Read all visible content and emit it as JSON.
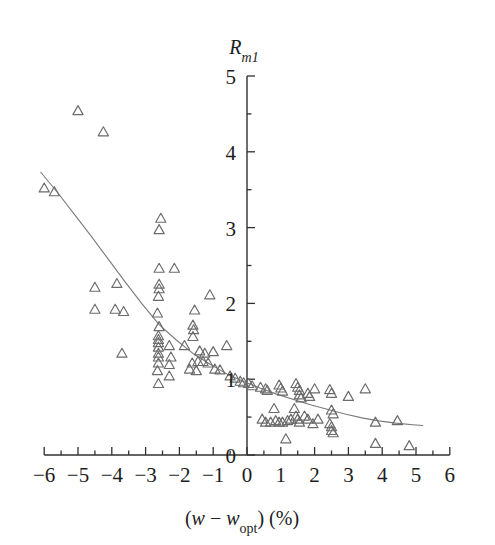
{
  "figure": {
    "background_color": "#ffffff",
    "marker_color": "#6b6b6b",
    "curve_color": "#7a7a7a",
    "axis_color": "#303030"
  },
  "axes": {
    "x": {
      "label_prefix": "(",
      "label_var1": "w",
      "label_minus": " − ",
      "label_var2": "w",
      "label_sub2": "opt",
      "label_suffix": ") (%)",
      "label_plain": "(w − w_opt) (%)",
      "min": -6,
      "max": 6,
      "major_ticks": [
        -6,
        -5,
        -4,
        -3,
        -2,
        -1,
        0,
        1,
        2,
        3,
        4,
        5,
        6
      ],
      "major_tick_labels": [
        "−6",
        "−5",
        "−4",
        "−3",
        "−2",
        "−1",
        "0",
        "1",
        "2",
        "3",
        "4",
        "5",
        "6"
      ],
      "minor_tick_step": 0.5
    },
    "y": {
      "label_var": "R",
      "label_sub": "m1",
      "label_plain": "R_m1",
      "min": 0,
      "max": 5,
      "major_ticks": [
        0,
        1,
        2,
        3,
        4,
        5
      ],
      "major_tick_labels": [
        "0",
        "1",
        "2",
        "3",
        "4",
        "5"
      ],
      "minor_tick_step": 0.5
    }
  },
  "chart_data": {
    "type": "scatter",
    "title": "",
    "xlabel": "(w − w_opt) (%)",
    "ylabel": "R_m1",
    "xlim": [
      -6,
      6
    ],
    "ylim": [
      0,
      5
    ],
    "grid": false,
    "legend": null,
    "marker": "triangle-up-open",
    "series": [
      {
        "name": "R_m1 vs (w - w_opt)",
        "points": [
          [
            -5.0,
            4.55
          ],
          [
            -4.25,
            4.27
          ],
          [
            -6.0,
            3.53
          ],
          [
            -5.7,
            3.48
          ],
          [
            -2.55,
            3.13
          ],
          [
            -2.6,
            2.98
          ],
          [
            -2.6,
            2.47
          ],
          [
            -2.15,
            2.47
          ],
          [
            -4.5,
            2.22
          ],
          [
            -3.85,
            2.27
          ],
          [
            -2.6,
            2.26
          ],
          [
            -2.6,
            2.2
          ],
          [
            -2.62,
            2.1
          ],
          [
            -1.1,
            2.12
          ],
          [
            -4.5,
            1.93
          ],
          [
            -3.9,
            1.93
          ],
          [
            -3.65,
            1.9
          ],
          [
            -2.65,
            1.88
          ],
          [
            -1.55,
            1.92
          ],
          [
            -2.6,
            1.7
          ],
          [
            -1.6,
            1.72
          ],
          [
            -1.58,
            1.66
          ],
          [
            -2.62,
            1.58
          ],
          [
            -2.62,
            1.53
          ],
          [
            -2.62,
            1.49
          ],
          [
            -1.6,
            1.57
          ],
          [
            -2.62,
            1.43
          ],
          [
            -2.3,
            1.45
          ],
          [
            -1.85,
            1.45
          ],
          [
            -0.6,
            1.45
          ],
          [
            -3.7,
            1.35
          ],
          [
            -2.62,
            1.35
          ],
          [
            -2.62,
            1.3
          ],
          [
            -2.25,
            1.3
          ],
          [
            -1.4,
            1.38
          ],
          [
            -1.25,
            1.35
          ],
          [
            -1.0,
            1.37
          ],
          [
            -2.62,
            1.22
          ],
          [
            -2.3,
            1.2
          ],
          [
            -1.62,
            1.22
          ],
          [
            -1.45,
            1.24
          ],
          [
            -1.3,
            1.24
          ],
          [
            -1.15,
            1.22
          ],
          [
            -2.65,
            1.12
          ],
          [
            -1.7,
            1.14
          ],
          [
            -1.5,
            1.12
          ],
          [
            -0.95,
            1.14
          ],
          [
            -0.8,
            1.13
          ],
          [
            -0.5,
            1.05
          ],
          [
            -0.35,
            1.02
          ],
          [
            -0.2,
            0.98
          ],
          [
            -0.1,
            0.96
          ],
          [
            0.05,
            0.95
          ],
          [
            0.15,
            0.92
          ],
          [
            0.4,
            0.9
          ],
          [
            0.55,
            0.88
          ],
          [
            0.6,
            0.86
          ],
          [
            0.95,
            0.93
          ],
          [
            1.0,
            0.89
          ],
          [
            1.05,
            0.85
          ],
          [
            1.45,
            0.95
          ],
          [
            1.5,
            0.9
          ],
          [
            1.55,
            0.86
          ],
          [
            1.55,
            0.8
          ],
          [
            1.6,
            0.76
          ],
          [
            1.8,
            0.82
          ],
          [
            1.85,
            0.78
          ],
          [
            2.0,
            0.88
          ],
          [
            2.45,
            0.87
          ],
          [
            2.5,
            0.82
          ],
          [
            3.0,
            0.78
          ],
          [
            3.5,
            0.88
          ],
          [
            0.45,
            0.48
          ],
          [
            0.55,
            0.44
          ],
          [
            0.7,
            0.44
          ],
          [
            0.85,
            0.46
          ],
          [
            0.95,
            0.44
          ],
          [
            1.05,
            0.44
          ],
          [
            1.2,
            0.46
          ],
          [
            1.3,
            0.48
          ],
          [
            1.45,
            0.52
          ],
          [
            1.5,
            0.48
          ],
          [
            1.55,
            0.44
          ],
          [
            1.7,
            0.52
          ],
          [
            1.8,
            0.48
          ],
          [
            1.95,
            0.42
          ],
          [
            2.1,
            0.48
          ],
          [
            2.45,
            0.42
          ],
          [
            2.5,
            0.38
          ],
          [
            2.5,
            0.33
          ],
          [
            1.15,
            0.22
          ],
          [
            2.55,
            0.3
          ],
          [
            3.8,
            0.44
          ],
          [
            4.45,
            0.46
          ],
          [
            3.8,
            0.16
          ],
          [
            4.8,
            0.13
          ],
          [
            2.5,
            0.6
          ],
          [
            2.55,
            0.55
          ],
          [
            0.8,
            0.62
          ],
          [
            1.4,
            0.62
          ],
          [
            -2.62,
            0.95
          ],
          [
            -2.3,
            1.05
          ]
        ]
      }
    ],
    "fit_curve": {
      "name": "fitted trend line",
      "points": [
        [
          -6.1,
          3.73
        ],
        [
          -5.6,
          3.46
        ],
        [
          -5.1,
          3.17
        ],
        [
          -4.6,
          2.88
        ],
        [
          -4.1,
          2.58
        ],
        [
          -3.6,
          2.28
        ],
        [
          -3.1,
          1.99
        ],
        [
          -2.6,
          1.72
        ],
        [
          -2.1,
          1.52
        ],
        [
          -1.6,
          1.34
        ],
        [
          -1.1,
          1.2
        ],
        [
          -0.6,
          1.07
        ],
        [
          -0.1,
          0.97
        ],
        [
          0.4,
          0.88
        ],
        [
          0.9,
          0.8
        ],
        [
          1.4,
          0.73
        ],
        [
          1.9,
          0.66
        ],
        [
          2.4,
          0.6
        ],
        [
          2.9,
          0.54
        ],
        [
          3.4,
          0.49
        ],
        [
          3.9,
          0.45
        ],
        [
          4.4,
          0.42
        ],
        [
          4.9,
          0.4
        ],
        [
          5.2,
          0.39
        ]
      ]
    }
  }
}
